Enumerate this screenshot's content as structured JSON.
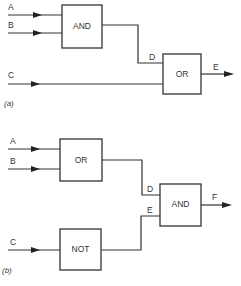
{
  "diagram_a": {
    "caption": "(a)",
    "inputs": [
      {
        "label": "A"
      },
      {
        "label": "B"
      },
      {
        "label": "C"
      }
    ],
    "gates": [
      {
        "label": "AND"
      },
      {
        "label": "OR"
      }
    ],
    "internal_signal": "D",
    "output": "E"
  },
  "diagram_b": {
    "caption": "(b)",
    "inputs": [
      {
        "label": "A"
      },
      {
        "label": "B"
      },
      {
        "label": "C"
      }
    ],
    "gates": [
      {
        "label": "OR"
      },
      {
        "label": "NOT"
      },
      {
        "label": "AND"
      }
    ],
    "internal_signals": [
      "D",
      "E"
    ],
    "output": "F"
  }
}
